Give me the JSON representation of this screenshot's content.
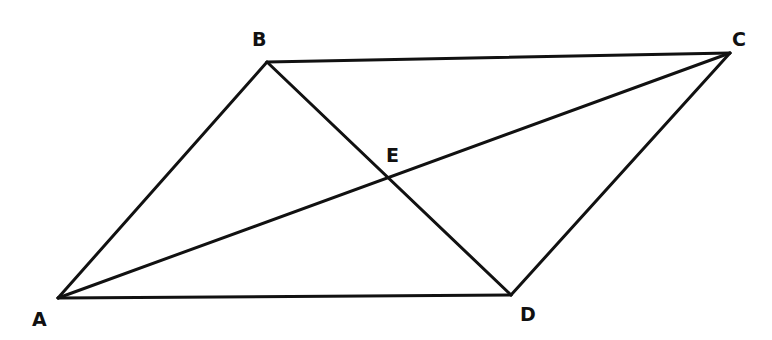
{
  "diagram": {
    "type": "parallelogram-with-diagonals",
    "stroke_color": "#111111",
    "background": "#ffffff",
    "points": {
      "A": {
        "label": "A",
        "x": 58,
        "y": 298,
        "label_x": 32,
        "label_y": 326
      },
      "B": {
        "label": "B",
        "x": 267,
        "y": 62,
        "label_x": 252,
        "label_y": 46
      },
      "C": {
        "label": "C",
        "x": 730,
        "y": 53,
        "label_x": 732,
        "label_y": 46
      },
      "D": {
        "label": "D",
        "x": 511,
        "y": 295,
        "label_x": 520,
        "label_y": 321
      },
      "E": {
        "label": "E",
        "x": 388,
        "y": 177,
        "label_x": 386,
        "label_y": 162
      }
    },
    "segments": [
      {
        "name": "AB",
        "from": "A",
        "to": "B"
      },
      {
        "name": "BC",
        "from": "B",
        "to": "C"
      },
      {
        "name": "CD",
        "from": "C",
        "to": "D"
      },
      {
        "name": "DA",
        "from": "D",
        "to": "A"
      },
      {
        "name": "AC",
        "from": "A",
        "to": "C"
      },
      {
        "name": "BD",
        "from": "B",
        "to": "D"
      }
    ]
  }
}
